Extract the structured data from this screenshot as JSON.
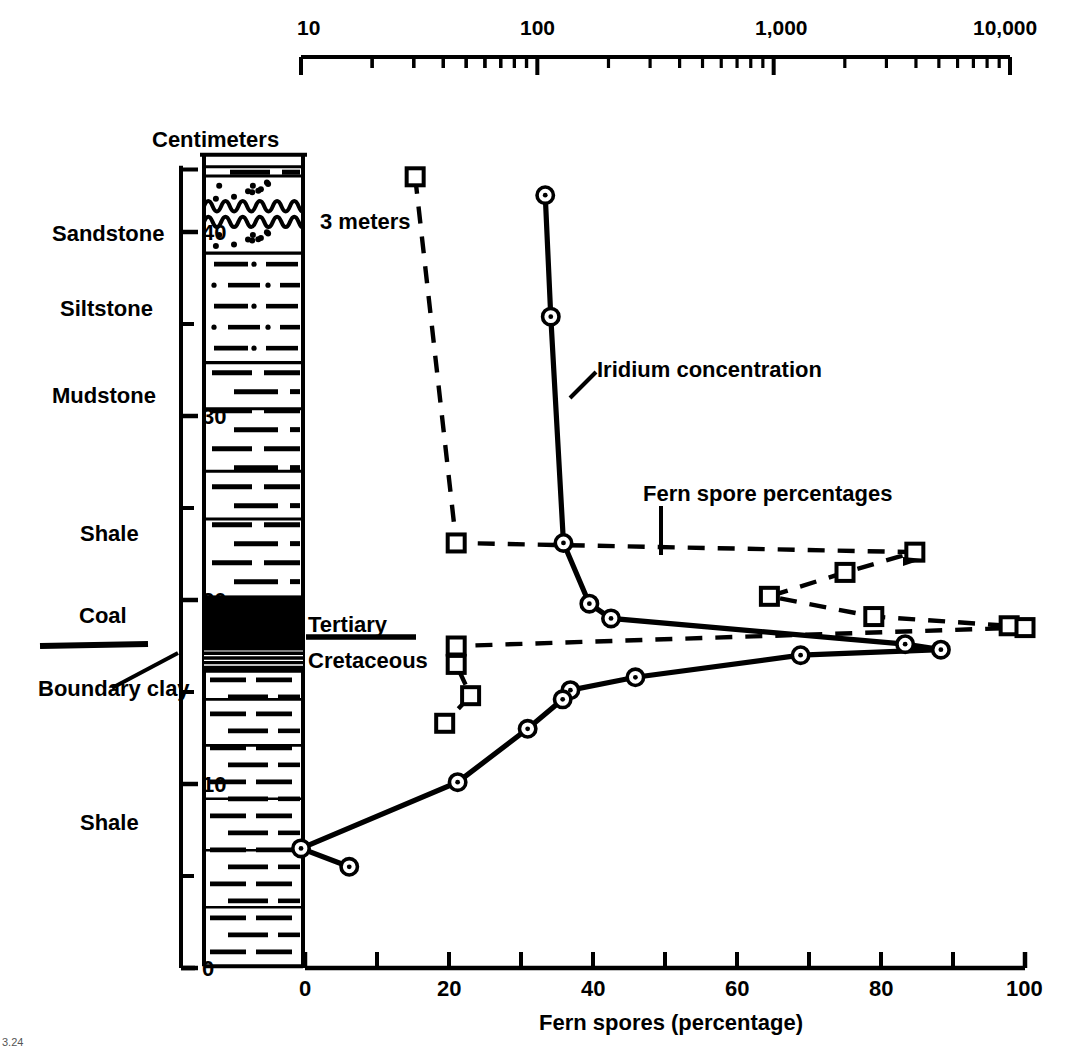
{
  "figure": {
    "caption_corner": "3.24"
  },
  "top_axis": {
    "name": "iridium-log-axis",
    "scale": "log",
    "min": 10,
    "max": 10000,
    "labels": [
      "10",
      "100",
      "1,000",
      "10,000"
    ],
    "label_values": [
      10,
      100,
      1000,
      10000
    ],
    "px_min_x": 301,
    "px_max_x": 1010,
    "y": 57
  },
  "bottom_axis": {
    "name": "fern-spore-axis",
    "title": "Fern spores (percentage)",
    "ticks": [
      0,
      10,
      20,
      30,
      40,
      50,
      60,
      70,
      80,
      90,
      100
    ],
    "labeled_ticks": [
      "0",
      "20",
      "40",
      "60",
      "80",
      "100"
    ],
    "labeled_values": [
      0,
      20,
      40,
      60,
      80,
      100
    ],
    "min": 0,
    "max": 100
  },
  "left_axis": {
    "name": "centimeters-axis",
    "title": "Centimeters",
    "labeled_ticks": [
      "0",
      "10",
      "20",
      "30",
      "40"
    ],
    "labeled_values": [
      0,
      10,
      20,
      30,
      40
    ],
    "minor_step": 5,
    "min": 0,
    "max": 44
  },
  "lithology": {
    "labels": [
      {
        "text": "Sandstone",
        "cm": 40.0
      },
      {
        "text": "Siltstone",
        "cm": 34.2
      },
      {
        "text": "Mudstone",
        "cm": 30.0
      },
      {
        "text": "Shale",
        "cm": 23.6
      },
      {
        "text": "Coal",
        "cm": 19.2
      },
      {
        "text": "Boundary clay",
        "cm": 14.6
      },
      {
        "text": "Shale",
        "cm": 8.5
      }
    ],
    "beds": [
      {
        "name": "shale-cap",
        "from_cm": 43.2,
        "to_cm": 44.0,
        "pattern": "shale"
      },
      {
        "name": "sandstone-upper",
        "from_cm": 41.2,
        "to_cm": 43.2,
        "pattern": "sandstone"
      },
      {
        "name": "sandstone-lower",
        "from_cm": 38.9,
        "to_cm": 40.7,
        "pattern": "sandstone"
      },
      {
        "name": "siltstone",
        "from_cm": 33.0,
        "to_cm": 38.9,
        "pattern": "siltstone"
      },
      {
        "name": "mudstone",
        "from_cm": 20.3,
        "to_cm": 33.0,
        "pattern": "mudstone"
      },
      {
        "name": "coal",
        "from_cm": 17.2,
        "to_cm": 20.3,
        "pattern": "coal"
      },
      {
        "name": "boundary-clay",
        "from_cm": 16.0,
        "to_cm": 17.2,
        "pattern": "clay"
      },
      {
        "name": "shale-main",
        "from_cm": 0.2,
        "to_cm": 16.0,
        "pattern": "shale"
      }
    ]
  },
  "annotations": {
    "three_meters": "3 meters",
    "iridium_label": "Iridium concentration",
    "fern_label": "Fern spore percentages",
    "tertiary": "Tertiary",
    "cretaceous": "Cretaceous",
    "centimeters": "Centimeters"
  },
  "chart_data": {
    "type": "line",
    "title": "",
    "xlabel": "Fern spores (percentage)",
    "ylabel": "Centimeters",
    "xlim": [
      0,
      100
    ],
    "ylim": [
      0,
      44
    ],
    "grid": false,
    "legend": "inline-annotations",
    "secondary_x": {
      "label": "Iridium concentration (parts per trillion)",
      "scale": "log",
      "lim": [
        10,
        10000
      ],
      "ticks": [
        10,
        100,
        1000,
        10000
      ]
    },
    "series": [
      {
        "name": "Fern spore percentages",
        "marker": "open-square",
        "line": "dashed",
        "x_axis": "bottom",
        "points": [
          {
            "percent": 15.3,
            "cm": 43.0
          },
          {
            "percent": 21.0,
            "cm": 23.1
          },
          {
            "percent": 84.7,
            "cm": 22.6
          },
          {
            "percent": 75.0,
            "cm": 21.5
          },
          {
            "percent": 64.5,
            "cm": 20.2
          },
          {
            "percent": 79.0,
            "cm": 19.1
          },
          {
            "percent": 97.8,
            "cm": 18.6
          },
          {
            "percent": 100.0,
            "cm": 18.5
          },
          {
            "percent": 21.0,
            "cm": 17.5
          },
          {
            "percent": 21.0,
            "cm": 16.5
          },
          {
            "percent": 23.0,
            "cm": 14.8
          },
          {
            "percent": 19.4,
            "cm": 13.3
          }
        ]
      },
      {
        "name": "Iridium concentration",
        "marker": "circle-dot",
        "line": "solid",
        "x_axis": "top-log",
        "points": [
          {
            "iridium": 108,
            "cm": 42.0
          },
          {
            "iridium": 114,
            "cm": 35.4
          },
          {
            "iridium": 129,
            "cm": 23.1
          },
          {
            "iridium": 166,
            "cm": 19.8
          },
          {
            "iridium": 205,
            "cm": 19.0
          },
          {
            "iridium": 3600,
            "cm": 17.6
          },
          {
            "iridium": 5100,
            "cm": 17.3
          },
          {
            "iridium": 1300,
            "cm": 17.0
          },
          {
            "iridium": 260,
            "cm": 15.8
          },
          {
            "iridium": 138,
            "cm": 15.1
          },
          {
            "iridium": 128,
            "cm": 14.6
          },
          {
            "iridium": 91,
            "cm": 13.0
          },
          {
            "iridium": 46,
            "cm": 10.1
          },
          {
            "iridium": 10,
            "cm": 6.5
          },
          {
            "iridium": 16,
            "cm": 5.5
          }
        ]
      }
    ]
  }
}
